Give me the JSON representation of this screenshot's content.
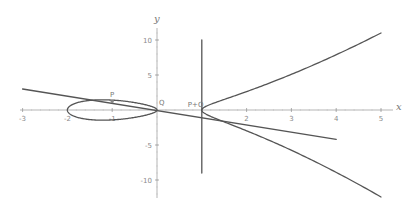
{
  "chart_data": {
    "type": "line",
    "title": "",
    "xlabel": "x",
    "ylabel": "y",
    "xlim": [
      -3.1,
      5.2
    ],
    "ylim": [
      -12.5,
      11.5
    ],
    "grid": false,
    "legend": null,
    "x_ticks": [
      -3,
      -2,
      -1,
      2,
      3,
      4,
      5
    ],
    "x_tick_labels": [
      "-3",
      "-2",
      "-1",
      "2",
      "3",
      "4",
      "5"
    ],
    "y_ticks": [
      10,
      5,
      -5,
      -10
    ],
    "y_tick_labels": [
      "10",
      "5",
      "-5",
      "-10"
    ],
    "series": [
      {
        "name": "elliptic curve y^2 = x^3 + x^2 - 2x",
        "equation": "y^2 = x(x+2)(x-1)",
        "kind": "implicit curve",
        "x_range": [
          -2,
          5
        ],
        "color": "#555555"
      },
      {
        "name": "secant line through P and Q",
        "x": [
          -3,
          4
        ],
        "y": [
          3.0,
          -4.2
        ],
        "color": "#555555"
      },
      {
        "name": "vertical line x = 1",
        "x": [
          1,
          1
        ],
        "y": [
          10,
          -9
        ],
        "color": "#555555"
      }
    ],
    "points": [
      {
        "label": "P",
        "x": -1,
        "y": 1.2
      },
      {
        "label": "Q",
        "x": 0,
        "y": 0
      },
      {
        "label": "P+Q",
        "x": 1,
        "y": -0.4
      }
    ],
    "axis_labels": {
      "x": "x",
      "y": "y"
    }
  }
}
